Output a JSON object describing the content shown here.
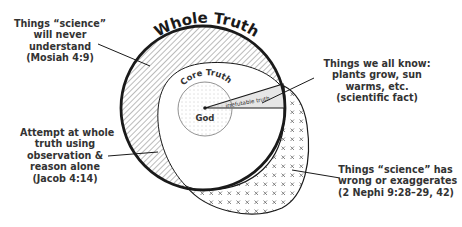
{
  "diagram": {
    "title": "Whole Truth",
    "regions": {
      "core_truth": "Core Truth",
      "god": "God",
      "irrefutable_truth": "irrefutable truth"
    },
    "callouts": [
      {
        "id": "never-understand",
        "lines": [
          "Things “science”",
          "will never",
          "understand",
          "(Mosiah 4:9)"
        ]
      },
      {
        "id": "all-know",
        "lines": [
          "Things we all know:",
          "plants grow, sun",
          "warms, etc.",
          "(scientific fact)"
        ]
      },
      {
        "id": "observation-reason",
        "lines": [
          "Attempt at whole",
          "truth using",
          "observation &",
          "reason alone",
          "(Jacob 4:14)"
        ]
      },
      {
        "id": "wrong-exaggerates",
        "lines": [
          "Things “science” has",
          "wrong or exaggerates",
          "(2 Nephi 9:28–29, 42)"
        ]
      }
    ],
    "colors": {
      "stroke": "#1a1a1a",
      "hatch": "#555555",
      "irrefutable_fill": "#e6e6e6",
      "core_dots": "#888888",
      "text": "#333333"
    }
  }
}
